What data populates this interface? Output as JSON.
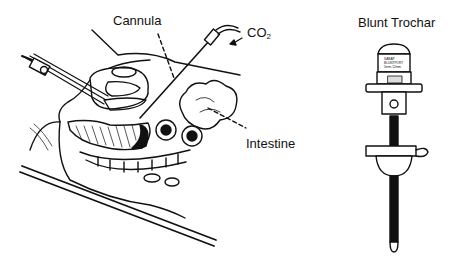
{
  "figure": {
    "left_panel": {
      "name": "laparoscopic-insertion-illustration",
      "labels": {
        "cannula": "Cannula",
        "co2_main": "CO",
        "co2_sub": "2",
        "intestine": "Intestine"
      }
    },
    "right_panel": {
      "name": "blunt-trochar-illustration",
      "title": "Blunt Trochar",
      "cap_text": [
        "SABAP",
        "BLUNTPORT",
        "5mm-12mm"
      ]
    },
    "colors": {
      "ink": "#111111",
      "background": "#ffffff"
    }
  }
}
